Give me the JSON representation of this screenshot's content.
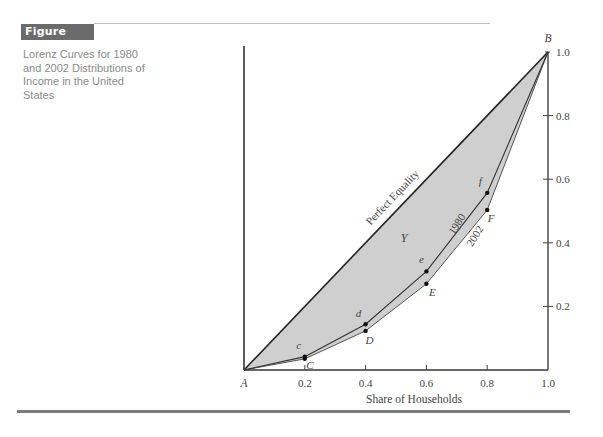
{
  "figure": {
    "label": "Figure 15A.1",
    "caption": "Lorenz Curves for 1980 and 2002 Distributions of Income in the United States",
    "badge_color": "#6b6b6b",
    "shade_color": "#cfcfcf"
  },
  "chart_data": {
    "type": "line",
    "title": "Lorenz Curves for 1980 and 2002 Distributions of Income in the United States",
    "xlabel": "Share of Households",
    "ylabel": "",
    "xlim": [
      0,
      1.0
    ],
    "ylim": [
      0,
      1.0
    ],
    "x_ticks": [
      0.2,
      0.4,
      0.6,
      0.8,
      1.0
    ],
    "x_tick_labels": [
      "0.2",
      "0.4",
      "0.6",
      "0.8",
      "1.0"
    ],
    "y_ticks": [
      0.2,
      0.4,
      0.6,
      0.8,
      1.0
    ],
    "y_tick_labels": [
      "0.2",
      "0.4",
      "0.6",
      "0.8",
      "1.0"
    ],
    "grid": false,
    "legend": "none (curves labeled inline)",
    "series": [
      {
        "name": "Perfect Equality",
        "x": [
          0,
          1.0
        ],
        "y": [
          0,
          1.0
        ]
      },
      {
        "name": "1980",
        "x": [
          0,
          0.2,
          0.4,
          0.6,
          0.8,
          1.0
        ],
        "y": [
          0,
          0.042,
          0.144,
          0.31,
          0.557,
          1.0
        ],
        "point_labels": [
          "",
          "c",
          "d",
          "e",
          "f",
          ""
        ]
      },
      {
        "name": "2002",
        "x": [
          0,
          0.2,
          0.4,
          0.6,
          0.8,
          1.0
        ],
        "y": [
          0,
          0.035,
          0.123,
          0.271,
          0.503,
          1.0
        ],
        "point_labels": [
          "",
          "C",
          "D",
          "E",
          "F",
          ""
        ]
      }
    ],
    "annotations": [
      {
        "text": "A",
        "x": 0,
        "y": 0,
        "role": "origin"
      },
      {
        "text": "B",
        "x": 1.0,
        "y": 1.0,
        "role": "top-right corner"
      },
      {
        "text": "Y",
        "x": 0.53,
        "y": 0.41,
        "role": "area between equality line and 1980 curve"
      },
      {
        "text": "Perfect Equality",
        "role": "label on diagonal"
      },
      {
        "text": "1980",
        "role": "label on 1980 curve"
      },
      {
        "text": "2002",
        "role": "label on 2002 curve"
      }
    ]
  }
}
